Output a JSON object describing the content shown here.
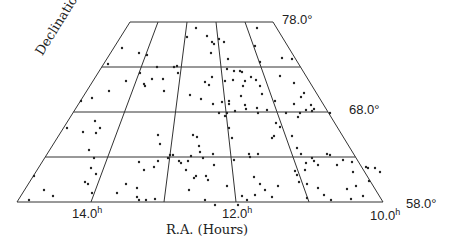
{
  "chart_data": {
    "type": "scatter",
    "title": "",
    "xlabel": "R.A. (Hours)",
    "ylabel": "Declination",
    "x_ticks": [
      {
        "label": "14.0",
        "unit": "h"
      },
      {
        "label": "12.0",
        "unit": "h"
      },
      {
        "label": "10.0",
        "unit": "h"
      }
    ],
    "y_ticks": [
      {
        "label": "78.0",
        "unit": "°"
      },
      {
        "label": "68.0",
        "unit": "°"
      },
      {
        "label": "58.0",
        "unit": "°"
      }
    ],
    "xlim_hours": [
      15.0,
      10.0
    ],
    "ylim_deg": [
      58.0,
      78.0
    ],
    "grid": true,
    "grid_ra_hours": [
      15.0,
      14.0,
      13.0,
      12.0,
      11.0,
      10.0
    ],
    "grid_dec_deg": [
      58.0,
      63.0,
      68.0,
      73.0,
      78.0
    ],
    "projection": "trapezoidal sky projection",
    "points_px": [
      [
        122,
        48
      ],
      [
        139,
        53
      ],
      [
        147,
        55
      ],
      [
        196,
        28
      ],
      [
        187,
        37
      ],
      [
        211,
        53
      ],
      [
        207,
        36
      ],
      [
        212,
        42
      ],
      [
        219,
        39
      ],
      [
        214,
        44
      ],
      [
        224,
        42
      ],
      [
        228,
        59
      ],
      [
        257,
        28
      ],
      [
        292,
        59
      ],
      [
        255,
        46
      ],
      [
        282,
        58
      ],
      [
        260,
        62
      ],
      [
        227,
        69
      ],
      [
        174,
        67
      ],
      [
        157,
        67
      ],
      [
        234,
        71
      ],
      [
        177,
        66
      ],
      [
        108,
        64
      ],
      [
        140,
        73
      ],
      [
        126,
        81
      ],
      [
        152,
        79
      ],
      [
        163,
        79
      ],
      [
        109,
        91
      ],
      [
        144,
        84
      ],
      [
        145,
        86
      ],
      [
        164,
        91
      ],
      [
        92,
        98
      ],
      [
        81,
        101
      ],
      [
        190,
        95
      ],
      [
        201,
        99
      ],
      [
        205,
        82
      ],
      [
        178,
        73
      ],
      [
        240,
        71
      ],
      [
        242,
        72
      ],
      [
        251,
        77
      ],
      [
        233,
        80
      ],
      [
        245,
        81
      ],
      [
        256,
        80
      ],
      [
        260,
        86
      ],
      [
        243,
        86
      ],
      [
        262,
        94
      ],
      [
        294,
        104
      ],
      [
        280,
        76
      ],
      [
        294,
        83
      ],
      [
        225,
        81
      ],
      [
        212,
        77
      ],
      [
        209,
        85
      ],
      [
        213,
        104
      ],
      [
        222,
        102
      ],
      [
        229,
        104
      ],
      [
        229,
        101
      ],
      [
        241,
        96
      ],
      [
        245,
        105
      ],
      [
        227,
        113
      ],
      [
        219,
        113
      ],
      [
        235,
        111
      ],
      [
        246,
        109
      ],
      [
        258,
        113
      ],
      [
        267,
        110
      ],
      [
        257,
        108
      ],
      [
        275,
        101
      ],
      [
        311,
        105
      ],
      [
        306,
        110
      ],
      [
        312,
        111
      ],
      [
        301,
        97
      ],
      [
        304,
        93
      ],
      [
        314,
        109
      ],
      [
        286,
        113
      ],
      [
        300,
        113
      ],
      [
        330,
        113
      ],
      [
        298,
        117
      ],
      [
        67,
        128
      ],
      [
        83,
        132
      ],
      [
        100,
        128
      ],
      [
        158,
        135
      ],
      [
        160,
        144
      ],
      [
        193,
        135
      ],
      [
        197,
        137
      ],
      [
        199,
        146
      ],
      [
        200,
        152
      ],
      [
        213,
        154
      ],
      [
        191,
        156
      ],
      [
        203,
        158
      ],
      [
        179,
        161
      ],
      [
        181,
        163
      ],
      [
        188,
        161
      ],
      [
        225,
        116
      ],
      [
        229,
        128
      ],
      [
        232,
        138
      ],
      [
        234,
        160
      ],
      [
        249,
        154
      ],
      [
        250,
        157
      ],
      [
        258,
        154
      ],
      [
        280,
        127
      ],
      [
        276,
        123
      ],
      [
        274,
        136
      ],
      [
        272,
        138
      ],
      [
        292,
        136
      ],
      [
        297,
        148
      ],
      [
        301,
        154
      ],
      [
        312,
        158
      ],
      [
        306,
        163
      ],
      [
        305,
        170
      ],
      [
        314,
        161
      ],
      [
        327,
        154
      ],
      [
        330,
        155
      ],
      [
        318,
        165
      ],
      [
        337,
        165
      ],
      [
        353,
        172
      ],
      [
        352,
        162
      ],
      [
        343,
        160
      ],
      [
        95,
        121
      ],
      [
        96,
        133
      ],
      [
        89,
        150
      ],
      [
        94,
        158
      ],
      [
        96,
        174
      ],
      [
        91,
        168
      ],
      [
        85,
        182
      ],
      [
        88,
        184
      ],
      [
        92,
        193
      ],
      [
        34,
        176
      ],
      [
        44,
        190
      ],
      [
        53,
        196
      ],
      [
        29,
        200
      ],
      [
        117,
        193
      ],
      [
        126,
        184
      ],
      [
        137,
        188
      ],
      [
        137,
        197
      ],
      [
        139,
        200
      ],
      [
        146,
        200
      ],
      [
        155,
        199
      ],
      [
        144,
        170
      ],
      [
        154,
        167
      ],
      [
        158,
        161
      ],
      [
        139,
        162
      ],
      [
        168,
        158
      ],
      [
        170,
        155
      ],
      [
        173,
        155
      ],
      [
        186,
        170
      ],
      [
        189,
        190
      ],
      [
        194,
        178
      ],
      [
        196,
        176
      ],
      [
        208,
        180
      ],
      [
        206,
        176
      ],
      [
        205,
        200
      ],
      [
        214,
        165
      ],
      [
        215,
        205
      ],
      [
        227,
        186
      ],
      [
        238,
        205
      ],
      [
        247,
        200
      ],
      [
        242,
        196
      ],
      [
        254,
        177
      ],
      [
        260,
        184
      ],
      [
        255,
        195
      ],
      [
        265,
        190
      ],
      [
        272,
        197
      ],
      [
        278,
        186
      ],
      [
        295,
        171
      ],
      [
        297,
        175
      ],
      [
        299,
        182
      ],
      [
        307,
        184
      ],
      [
        318,
        188
      ],
      [
        324,
        195
      ],
      [
        331,
        200
      ],
      [
        347,
        189
      ],
      [
        351,
        199
      ],
      [
        363,
        196
      ],
      [
        369,
        181
      ],
      [
        356,
        186
      ],
      [
        366,
        167
      ],
      [
        368,
        168
      ],
      [
        375,
        168
      ],
      [
        380,
        172
      ],
      [
        307,
        198
      ]
    ]
  },
  "labels": {
    "dec_top": "78.0",
    "dec_mid": "68.0",
    "dec_bottom": "58.0",
    "deg": "°",
    "ra_left": "14.0",
    "ra_mid": "12.0",
    "ra_right": "10.0",
    "hour": "h",
    "xlabel": "R.A. (Hours)",
    "ylabel": "Declination"
  },
  "colors": {
    "line": "#333333",
    "point": "#222222",
    "background": "#ffffff"
  }
}
